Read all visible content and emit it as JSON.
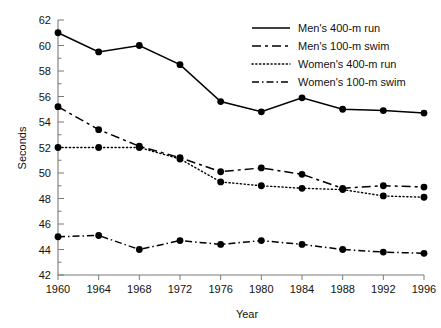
{
  "chart_data": {
    "type": "line",
    "title": "",
    "xlabel": "Year",
    "ylabel": "Seconds",
    "x": [
      1960,
      1964,
      1968,
      1972,
      1976,
      1980,
      1984,
      1988,
      1992,
      1996
    ],
    "categories": [
      "1960",
      "1964",
      "1968",
      "1972",
      "1976",
      "1980",
      "1984",
      "1988",
      "1992",
      "1996"
    ],
    "xlim": [
      1960,
      1996
    ],
    "ylim": [
      42,
      62
    ],
    "ytick_labels": [
      "42",
      "44",
      "46",
      "48",
      "50",
      "52",
      "54",
      "56",
      "58",
      "60",
      "62"
    ],
    "ytick_values": [
      42,
      44,
      46,
      48,
      50,
      52,
      54,
      56,
      58,
      60,
      62
    ],
    "yminor_step": 1,
    "grid": false,
    "legend_position": "top-right",
    "series": [
      {
        "name": "Men's 400-m run",
        "style": "solid",
        "marker": "filled-circle",
        "color": "#000000",
        "values": [
          61.0,
          59.5,
          60.0,
          58.5,
          55.6,
          54.8,
          55.9,
          55.0,
          54.9,
          54.7
        ]
      },
      {
        "name": "Men's 100-m swim",
        "style": "dashed",
        "marker": "filled-circle",
        "color": "#000000",
        "values": [
          55.2,
          53.4,
          52.1,
          51.2,
          50.1,
          50.4,
          49.9,
          48.8,
          49.0,
          48.9
        ]
      },
      {
        "name": "Women's 400-m run",
        "style": "dotted",
        "marker": "filled-circle",
        "color": "#000000",
        "values": [
          52.0,
          52.0,
          52.0,
          51.1,
          49.3,
          49.0,
          48.8,
          48.7,
          48.2,
          48.1
        ]
      },
      {
        "name": "Women's 100-m swim",
        "style": "dash-dot",
        "marker": "filled-circle",
        "color": "#000000",
        "values": [
          45.0,
          45.1,
          44.0,
          44.7,
          44.4,
          44.7,
          44.4,
          44.0,
          43.8,
          43.7
        ]
      }
    ]
  },
  "axes": {
    "x_title": "Year",
    "y_title": "Seconds"
  },
  "legend": {
    "entries": [
      {
        "label": "Men's 400-m run"
      },
      {
        "label": "Men's 100-m swim"
      },
      {
        "label": "Women's 400-m run"
      },
      {
        "label": "Women's 100-m swim"
      }
    ]
  },
  "colors": {
    "ink": "#000000",
    "axis": "#7a7a7a",
    "background": "#ffffff"
  }
}
